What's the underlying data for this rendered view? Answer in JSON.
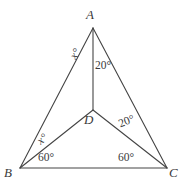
{
  "figure": {
    "type": "geometry-diagram",
    "stroke_color": "#444444",
    "background_color": "#ffffff",
    "vertices": [
      {
        "name": "A",
        "label": "A",
        "x": 93,
        "y": 28
      },
      {
        "name": "B",
        "label": "B",
        "x": 20,
        "y": 168
      },
      {
        "name": "C",
        "label": "C",
        "x": 167,
        "y": 168
      },
      {
        "name": "D",
        "label": "D",
        "x": 93,
        "y": 110
      }
    ],
    "segments": [
      {
        "from": "A",
        "to": "B"
      },
      {
        "from": "A",
        "to": "C"
      },
      {
        "from": "B",
        "to": "C"
      },
      {
        "from": "A",
        "to": "D"
      },
      {
        "from": "B",
        "to": "D"
      },
      {
        "from": "D",
        "to": "C"
      }
    ],
    "angle_labels": [
      {
        "id": "angle-A-x",
        "text": "x°",
        "at_vertex": "A",
        "between": "AB and AD"
      },
      {
        "id": "angle-A-20",
        "text": "20°",
        "at_vertex": "A",
        "between": "AD and AC"
      },
      {
        "id": "angle-D-20",
        "text": "20°",
        "at_vertex": "D",
        "between": "DC and DA"
      },
      {
        "id": "angle-B-x",
        "text": "x°",
        "at_vertex": "B",
        "between": "BA and BD"
      },
      {
        "id": "angle-B-60",
        "text": "60°",
        "at_vertex": "B",
        "between": "BD and BC"
      },
      {
        "id": "angle-C-60",
        "text": "60°",
        "at_vertex": "C",
        "between": "CD and CB"
      }
    ]
  }
}
